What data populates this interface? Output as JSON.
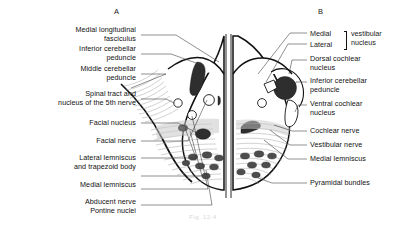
{
  "figure": {
    "caption": "Fig. 12-4",
    "background_color": "#ffffff",
    "ink_color": "#111111"
  },
  "panels": [
    {
      "id": "A",
      "letter": "A"
    },
    {
      "id": "B",
      "letter": "B"
    }
  ],
  "left_labels": [
    {
      "name": "medial-longitudinal-fasciculus",
      "text": "Medial longitudinal\nfasciculus"
    },
    {
      "name": "inferior-cerebellar-peduncle",
      "text": "Inferior cerebellar\npeduncle"
    },
    {
      "name": "middle-cerebellar-peduncle",
      "text": "Middle cerebellar\npeduncle"
    },
    {
      "name": "spinal-tract-nucleus-5th-nerve",
      "text": "Spinal tract and\nnucleus of the 5th nerve"
    },
    {
      "name": "facial-nucleus",
      "text": "Facial nucleus"
    },
    {
      "name": "facial-nerve",
      "text": "Facial nerve"
    },
    {
      "name": "lateral-lemniscus-trapezoid-body",
      "text": "Lateral lemniscus\nand trapezoid body"
    },
    {
      "name": "medial-lemniscus",
      "text": "Medial lemniscus"
    },
    {
      "name": "abducent-nerve",
      "text": "Abducent nerve"
    },
    {
      "name": "pontine-nuclei",
      "text": "Pontine nuclei"
    }
  ],
  "vestibular_group": {
    "sub_labels": [
      "Medial",
      "Lateral"
    ],
    "group_name": "vestibular\nnucleus"
  },
  "right_labels": [
    {
      "name": "dorsal-cochlear-nucleus",
      "text": "Dorsal cochlear\nnucleus"
    },
    {
      "name": "inferior-cerebellar-peduncle",
      "text": "Inferior cerebellar\npeduncle"
    },
    {
      "name": "ventral-cochlear-nucleus",
      "text": "Ventral cochlear\nnucleus"
    },
    {
      "name": "cochlear-nerve",
      "text": "Cochlear nerve"
    },
    {
      "name": "vestibular-nerve",
      "text": "Vestibular nerve"
    },
    {
      "name": "medial-lemniscus",
      "text": "Medial lemniscus"
    },
    {
      "name": "pyramidal-bundles",
      "text": "Pyramidal bundles"
    }
  ]
}
